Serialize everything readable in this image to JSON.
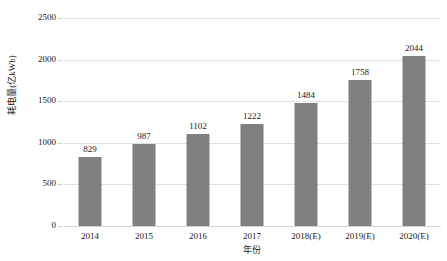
{
  "chart_data": {
    "type": "bar",
    "title": "",
    "xlabel": "年份",
    "ylabel": "耗电量(亿kWh)",
    "categories": [
      "2014",
      "2015",
      "2016",
      "2017",
      "2018(E)",
      "2019(E)",
      "2020(E)"
    ],
    "values": [
      829,
      987,
      1102,
      1222,
      1484,
      1758,
      2044
    ],
    "data_labels": [
      "829",
      "987",
      "1102",
      "1222",
      "1484",
      "1758",
      "2044"
    ],
    "ylim": [
      0,
      2500
    ],
    "ytick_labels": [
      "0",
      "500",
      "1000",
      "1500",
      "2000",
      "2500"
    ],
    "ytick_values": [
      0,
      500,
      1000,
      1500,
      2000,
      2500
    ],
    "grid": true,
    "legend": false,
    "series": [
      {
        "name": "耗电量",
        "values": [
          829,
          987,
          1102,
          1222,
          1484,
          1758,
          2044
        ],
        "color": "#808080"
      }
    ]
  },
  "colors": {
    "bar": "#808080",
    "gridline": "#e2e2e2",
    "axis": "#d4d4d4",
    "text": "#1a1a1a",
    "background": "#ffffff"
  }
}
